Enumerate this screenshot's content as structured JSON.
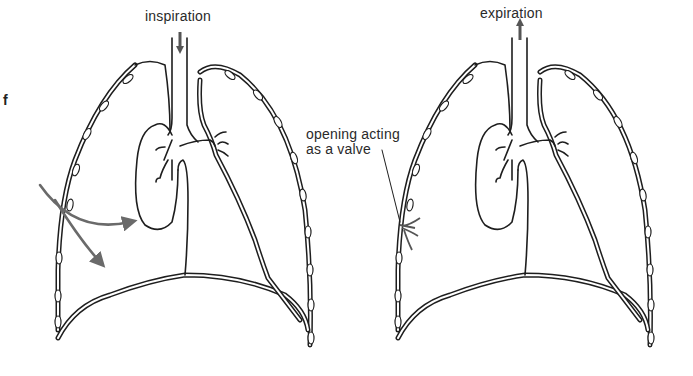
{
  "figure": {
    "panel_letter": "f",
    "left_panel": {
      "phase_label": "inspiration",
      "arrow_direction": "down"
    },
    "right_panel": {
      "phase_label": "expiration",
      "arrow_direction": "up",
      "annotation": {
        "line1": "opening acting",
        "line2": "as a valve"
      }
    },
    "colors": {
      "line": "#1e1e1e",
      "air_arrow": "#6a6a6a",
      "background": "#ffffff"
    }
  }
}
